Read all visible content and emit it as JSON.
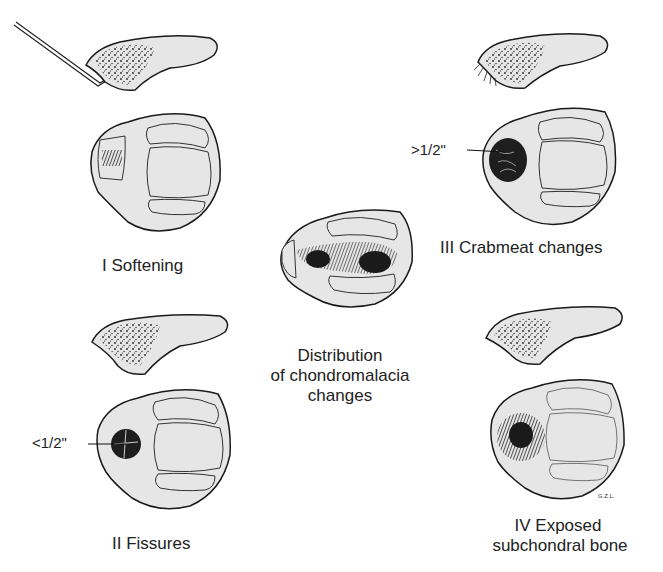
{
  "diagram": {
    "panels": [
      {
        "id": "I",
        "grade": "I",
        "label": "I  Softening"
      },
      {
        "id": "II",
        "grade": "II",
        "label": "II  Fissures",
        "measurement": "<1/2\""
      },
      {
        "id": "III",
        "grade": "III",
        "label": "III  Crabmeat changes",
        "measurement": ">1/2\""
      },
      {
        "id": "IV",
        "grade": "IV",
        "label_line1": "IV  Exposed",
        "label_line2": "subchondral bone"
      }
    ],
    "center": {
      "line1": "Distribution",
      "line2": "of chondromalacia",
      "line3": "changes"
    },
    "signature": "G.Z.L."
  },
  "colors": {
    "fill": "#e6e6e6",
    "stroke": "#1a1a1a",
    "background": "#ffffff"
  }
}
